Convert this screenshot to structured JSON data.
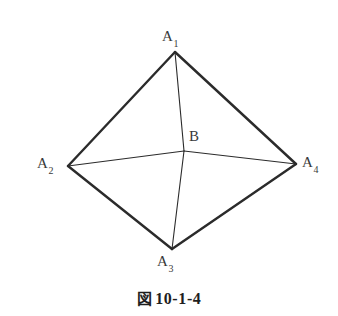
{
  "figure": {
    "caption_mark": "図",
    "caption_number": "10-1-4",
    "caption_full": "図 10-1-4",
    "background_color": "#ffffff",
    "stroke_color": "#2b2b2b",
    "label_color": "#3a3a3a",
    "outer_stroke_width": 2.4,
    "inner_stroke_width": 1.1
  },
  "vertices": [
    {
      "id": "A1",
      "label_main": "A",
      "label_sub": "1",
      "x": 175,
      "y": 52,
      "label_x": 162,
      "label_y": 29
    },
    {
      "id": "A2",
      "label_main": "A",
      "label_sub": "2",
      "x": 68,
      "y": 166,
      "label_x": 37,
      "label_y": 156
    },
    {
      "id": "A3",
      "label_main": "A",
      "label_sub": "3",
      "x": 172,
      "y": 249,
      "label_x": 157,
      "label_y": 254
    },
    {
      "id": "A4",
      "label_main": "A",
      "label_sub": "4",
      "x": 296,
      "y": 164,
      "label_x": 302,
      "label_y": 155
    }
  ],
  "interior_point": {
    "id": "B",
    "label_main": "B",
    "x": 184,
    "y": 151,
    "label_x": 189,
    "label_y": 129
  },
  "edges": [
    {
      "id": "A1-A2",
      "from": "A1",
      "to": "A2",
      "kind": "outer"
    },
    {
      "id": "A2-A3",
      "from": "A2",
      "to": "A3",
      "kind": "outer"
    },
    {
      "id": "A3-A4",
      "from": "A3",
      "to": "A4",
      "kind": "outer"
    },
    {
      "id": "A4-A1",
      "from": "A4",
      "to": "A1",
      "kind": "outer"
    }
  ],
  "spokes": [
    {
      "id": "A1-B",
      "from": "A1",
      "to": "B",
      "kind": "inner"
    },
    {
      "id": "A2-B",
      "from": "A2",
      "to": "B",
      "kind": "inner"
    },
    {
      "id": "A3-B",
      "from": "A3",
      "to": "B",
      "kind": "inner"
    },
    {
      "id": "A4-B",
      "from": "A4",
      "to": "B",
      "kind": "inner"
    }
  ]
}
